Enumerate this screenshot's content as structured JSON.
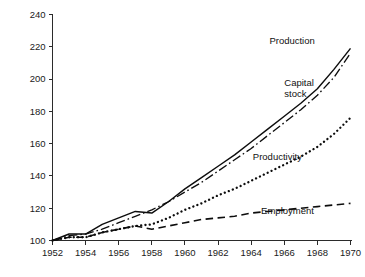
{
  "chart_data": {
    "type": "line",
    "title": "",
    "subtitle": "",
    "xlabel": "",
    "ylabel": "",
    "xlim": [
      1952,
      1970
    ],
    "ylim": [
      100,
      240
    ],
    "grid": false,
    "legend_position": "inline-annotations",
    "x_ticks": [
      1952,
      1954,
      1956,
      1958,
      1960,
      1962,
      1964,
      1966,
      1968,
      1970
    ],
    "y_ticks": [
      100,
      120,
      140,
      160,
      180,
      200,
      220,
      240
    ],
    "x_tick_labels": [
      "1952",
      "1954",
      "1956",
      "1958",
      "1960",
      "1962",
      "1964",
      "1966",
      "1968",
      "1970"
    ],
    "y_tick_labels": [
      "100",
      "120",
      "140",
      "160",
      "180",
      "200",
      "220",
      "240"
    ],
    "x": [
      1952,
      1953,
      1954,
      1955,
      1956,
      1957,
      1958,
      1959,
      1960,
      1961,
      1962,
      1963,
      1964,
      1965,
      1966,
      1967,
      1968,
      1969,
      1970
    ],
    "series": [
      {
        "name": "Production",
        "style": "solid",
        "color": "#0d0d0d",
        "label": "Production",
        "label_x": 1965.1,
        "label_y": 222.0,
        "values": [
          100,
          104,
          104,
          110,
          114,
          118,
          117,
          124,
          132,
          139,
          146,
          153,
          161,
          169,
          177,
          185,
          194,
          206,
          219
        ]
      },
      {
        "name": "Capital stock",
        "style": "dash-dot",
        "color": "#0d0d0d",
        "label": "Capital stock",
        "label_line1": "Capital",
        "label_line2": "stock",
        "label_x": 1966.0,
        "label_y": 196.0,
        "values": [
          100,
          103,
          104,
          107,
          111,
          115,
          119,
          124,
          130,
          136,
          143,
          150,
          157,
          165,
          173,
          181,
          190,
          201,
          216
        ]
      },
      {
        "name": "Productivity",
        "style": "dotted",
        "color": "#0d0d0d",
        "label": "Productivity",
        "label_x": 1964.1,
        "label_y": 150.0,
        "values": [
          100,
          102,
          102,
          105,
          107,
          109,
          110,
          114,
          119,
          123,
          128,
          132,
          137,
          142,
          147,
          152,
          158,
          166,
          176
        ]
      },
      {
        "name": "Employment",
        "style": "dashed",
        "color": "#0d0d0d",
        "label": "Employment",
        "label_x": 1964.6,
        "label_y": 116.5,
        "values": [
          100,
          102,
          102,
          105,
          107,
          109,
          107,
          109,
          111,
          113,
          114,
          115,
          117,
          118,
          119,
          120,
          121,
          122,
          123
        ]
      }
    ]
  }
}
